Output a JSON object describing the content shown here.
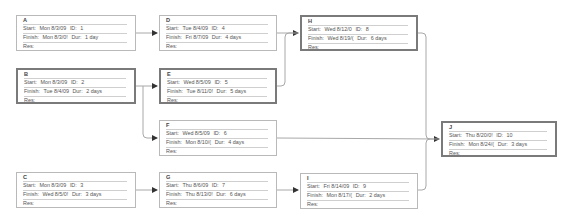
{
  "diagram": {
    "type": "network-diagram",
    "labels": {
      "start": "Start:",
      "finish": "Finish:",
      "id": "ID:",
      "dur": "Dur:",
      "res": "Res:"
    },
    "colors": {
      "normal_border": "#b9b9b9",
      "critical_border": "#7a7a7a",
      "connector": "#a8a8a8",
      "arrowhead": "#333333"
    },
    "nodes": [
      {
        "key": "A",
        "name": "A",
        "start": "Mon 8/3/09",
        "id": "1",
        "finish": "Mon 8/3/0!",
        "dur": "1 day",
        "res": "",
        "critical": false
      },
      {
        "key": "B",
        "name": "B",
        "start": "Mon 8/3/09",
        "id": "2",
        "finish": "Tue 8/4/09",
        "dur": "2 days",
        "res": "",
        "critical": true
      },
      {
        "key": "C",
        "name": "C",
        "start": "Mon 8/3/09",
        "id": "3",
        "finish": "Wed 8/5/0!",
        "dur": "3 days",
        "res": "",
        "critical": false
      },
      {
        "key": "D",
        "name": "D",
        "start": "Tue 8/4/09",
        "id": "4",
        "finish": "Fri 8/7/09",
        "dur": "4 days",
        "res": "",
        "critical": false
      },
      {
        "key": "E",
        "name": "E",
        "start": "Wed 8/5/09",
        "id": "5",
        "finish": "Tue 8/11/0!",
        "dur": "5 days",
        "res": "",
        "critical": true
      },
      {
        "key": "F",
        "name": "F",
        "start": "Wed 8/5/09",
        "id": "6",
        "finish": "Mon 8/10/(",
        "dur": "4 days",
        "res": "",
        "critical": false
      },
      {
        "key": "G",
        "name": "G",
        "start": "Thu 8/6/09",
        "id": "7",
        "finish": "Thu 8/13/0!",
        "dur": "6 days",
        "res": "",
        "critical": false
      },
      {
        "key": "H",
        "name": "H",
        "start": "Wed 8/12/0",
        "id": "8",
        "finish": "Wed 8/19/(",
        "dur": "6 days",
        "res": "",
        "critical": true
      },
      {
        "key": "I",
        "name": "I",
        "start": "Fri 8/14/09",
        "id": "9",
        "finish": "Mon 8/17/(",
        "dur": "2 days",
        "res": "",
        "critical": false
      },
      {
        "key": "J",
        "name": "J",
        "start": "Thu 8/20/0!",
        "id": "10",
        "finish": "Mon 8/24/(",
        "dur": "3 days",
        "res": "",
        "critical": true
      }
    ],
    "links": [
      {
        "from": "A",
        "to": "D"
      },
      {
        "from": "B",
        "to": "E"
      },
      {
        "from": "B",
        "to": "F"
      },
      {
        "from": "C",
        "to": "G"
      },
      {
        "from": "D",
        "to": "H"
      },
      {
        "from": "E",
        "to": "H"
      },
      {
        "from": "G",
        "to": "I"
      },
      {
        "from": "H",
        "to": "J"
      },
      {
        "from": "F",
        "to": "J"
      },
      {
        "from": "I",
        "to": "J"
      }
    ]
  }
}
